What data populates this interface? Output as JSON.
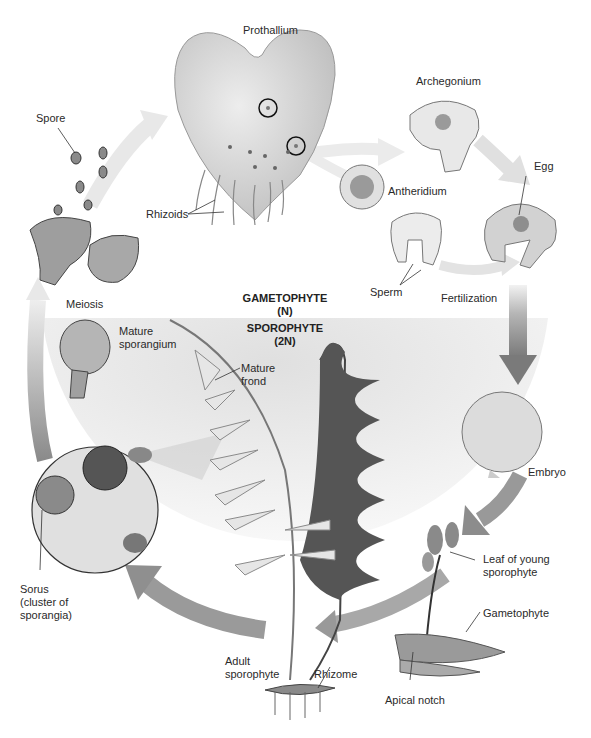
{
  "diagram": {
    "phases": {
      "gametophyte": {
        "name": "GAMETOPHYTE",
        "ploidy": "(N)"
      },
      "sporophyte": {
        "name": "SPOROPHYTE",
        "ploidy": "(2N)"
      }
    },
    "labels": {
      "prothallium": "Prothallium",
      "spore": "Spore",
      "rhizoids": "Rhizoids",
      "archegonium": "Archegonium",
      "antheridium": "Antheridium",
      "egg": "Egg",
      "sperm": "Sperm",
      "fertilization": "Fertilization",
      "meiosis": "Meiosis",
      "mature_sporangium_1": "Mature",
      "mature_sporangium_2": "sporangium",
      "mature_frond_1": "Mature",
      "mature_frond_2": "frond",
      "embryo": "Embryo",
      "leaf_young_1": "Leaf of young",
      "leaf_young_2": "sporophyte",
      "gametophyte": "Gametophyte",
      "apical_notch": "Apical notch",
      "sorus_1": "Sorus",
      "sorus_2": "(cluster of",
      "sorus_3": "sporangia)",
      "adult_sporophyte_1": "Adult",
      "adult_sporophyte_2": "sporophyte",
      "rhizome": "Rhizome"
    },
    "colors": {
      "arrow_light": "#e6e6e6",
      "arrow_dark": "#8c8c8c",
      "sporophyte_bg": "#e9e9e9",
      "structure_fill": "#d8d8d8",
      "frond_dark": "#555555"
    }
  }
}
